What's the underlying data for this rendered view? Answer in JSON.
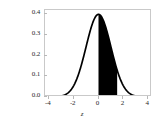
{
  "chart_data": {
    "type": "area",
    "title": "",
    "subtitle": "",
    "xlabel": "z",
    "ylabel": "",
    "xlim": [
      -4.3,
      4.3
    ],
    "ylim": [
      0.0,
      0.42
    ],
    "grid": false,
    "legend": null,
    "curve": {
      "name": "standard normal density",
      "distribution": "normal",
      "mean": 0,
      "sd": 1,
      "peak_value": 0.3989,
      "color": "#000000",
      "line_width": 1.6
    },
    "shaded_region": {
      "name": "area under curve",
      "from": 0.0,
      "to": 1.5,
      "fill_color": "#000000",
      "area": 0.4332
    },
    "x_ticks": [
      {
        "value": -4,
        "label": "-4"
      },
      {
        "value": -2,
        "label": "-2"
      },
      {
        "value": 0,
        "label": "0"
      },
      {
        "value": 2,
        "label": "2"
      },
      {
        "value": 4,
        "label": "4"
      }
    ],
    "y_ticks": [
      {
        "value": 0.0,
        "label": "0.0"
      },
      {
        "value": 0.1,
        "label": "0.1"
      },
      {
        "value": 0.2,
        "label": "0.2"
      },
      {
        "value": 0.3,
        "label": "0.3"
      },
      {
        "value": 0.4,
        "label": "0.4"
      }
    ],
    "frame_color": "#c9c9c9",
    "background": "#ffffff"
  }
}
